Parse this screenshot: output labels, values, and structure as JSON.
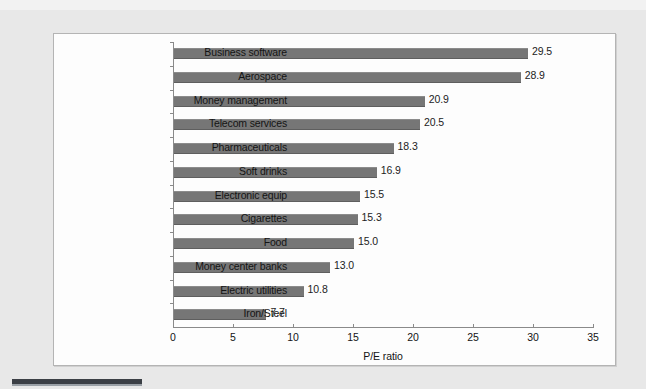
{
  "chart_data": {
    "type": "bar",
    "orientation": "horizontal",
    "title": "",
    "xlabel": "P/E ratio",
    "ylabel": "",
    "xlim": [
      0,
      35
    ],
    "xticks": [
      0,
      5,
      10,
      15,
      20,
      25,
      30,
      35
    ],
    "xtick_labels": [
      "0",
      "5",
      "10",
      "15",
      "20",
      "25",
      "30",
      "35"
    ],
    "grid": false,
    "legend": null,
    "bar_color": "#767676",
    "categories": [
      "Business software",
      "Aerospace",
      "Money management",
      "Telecom services",
      "Pharmaceuticals",
      "Soft drinks",
      "Electronic equip",
      "Cigarettes",
      "Food",
      "Money center banks",
      "Electric utilities",
      "Iron/Steel"
    ],
    "values": [
      29.5,
      28.9,
      20.9,
      20.5,
      18.3,
      16.9,
      15.5,
      15.3,
      15.0,
      13.0,
      10.8,
      7.7
    ],
    "value_labels": [
      "29.5",
      "28.9",
      "20.9",
      "20.5",
      "18.3",
      "16.9",
      "15.5",
      "15.3",
      "15.0",
      "13.0",
      "10.8",
      "7.7"
    ]
  }
}
